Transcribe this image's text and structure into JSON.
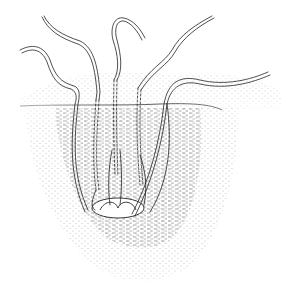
{
  "illustration": {
    "subject": "worms-in-sediment-burrow",
    "style": "stippled line drawing",
    "colors": {
      "background": "#ffffff",
      "ink": "#1a1a1a",
      "stipple": "#555555"
    },
    "worm_count": 5,
    "elements": [
      "sediment-surface-line",
      "stippled-sediment",
      "burrow-pit",
      "worm-tails",
      "buried-worm-bodies"
    ]
  }
}
